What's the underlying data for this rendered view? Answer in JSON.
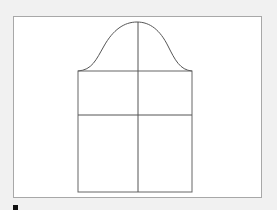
{
  "diagram": {
    "type": "sleeve-pattern",
    "frame": {
      "x": 13,
      "y": 16,
      "width": 249,
      "height": 182
    },
    "colors": {
      "background": "#f1f1f1",
      "frame_fill": "#ffffff",
      "frame_border": "#a8a8a8",
      "line": "#555555",
      "marker": "#111111"
    },
    "shapes": {
      "cap_curve": {
        "left_x": 78,
        "right_x": 192,
        "base_y": 71,
        "peak_x": 137,
        "peak_y": 22
      },
      "body_rect": {
        "x": 78,
        "y": 71,
        "width": 114,
        "height": 121
      },
      "center_line": {
        "x": 138,
        "y1": 22,
        "y2": 192
      },
      "cross_line": {
        "y": 115
      }
    }
  }
}
